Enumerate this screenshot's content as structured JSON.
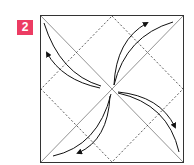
{
  "step": {
    "number": "2",
    "badge_color": "#ec3c63"
  },
  "diagram": {
    "type": "origami-fold-step",
    "line_color": "#222222",
    "crease_color": "#666666"
  }
}
